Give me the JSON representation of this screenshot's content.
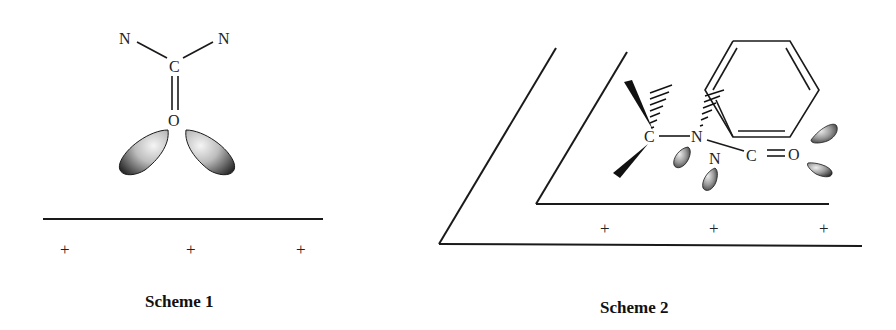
{
  "figure": {
    "type": "chemistry-orbital-scheme",
    "colors": {
      "ink": "#1a1a1a",
      "lobe_light": "#f2f2f2",
      "lobe_dark": "#2e2e2e",
      "background": "#ffffff"
    }
  },
  "scheme1": {
    "caption": "Scheme 1",
    "atoms": {
      "n_left": "N",
      "n_right": "N",
      "carbon": "C",
      "oxygen": "O"
    },
    "charges": [
      "+",
      "+",
      "+"
    ]
  },
  "scheme2": {
    "caption": "Scheme 2",
    "atoms": {
      "carbon_quaternary": "C",
      "nitrogen_amide": "N",
      "nitrogen_lower": "N",
      "carbon_carbonyl": "C",
      "oxygen": "O"
    },
    "charges": [
      "+",
      "+",
      "+"
    ]
  }
}
